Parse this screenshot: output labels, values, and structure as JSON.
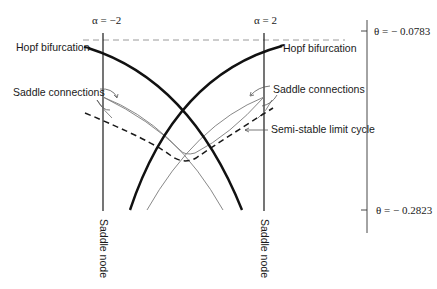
{
  "diagram": {
    "type": "bifurcation-diagram",
    "parameters": {
      "alpha_left": "α = −2",
      "alpha_right": "α = 2"
    },
    "theta_scale": {
      "top": "θ = − 0.0783",
      "bottom": "θ = − 0.2823"
    },
    "labels": {
      "hopf_left": "Hopf bifurcation",
      "hopf_right": "Hopf bifurcation",
      "saddle_conn_left": "Saddle connections",
      "saddle_conn_right": "Saddle connections",
      "semi_stable": "Semi-stable limit cycle",
      "saddle_node_left": "Saddle node",
      "saddle_node_right": "Saddle node"
    },
    "colors": {
      "ink": "#1a1a1a",
      "thin": "#7a7a7a",
      "dash_top": "#9a9a9a"
    }
  }
}
